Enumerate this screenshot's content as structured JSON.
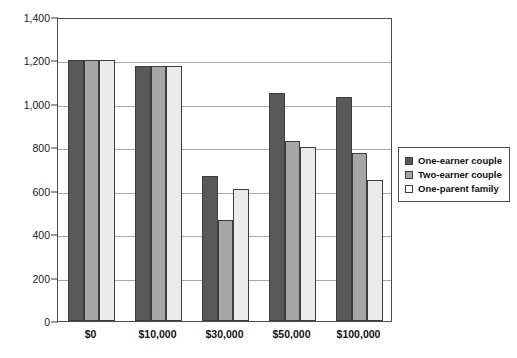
{
  "chart_data": {
    "type": "bar",
    "title": "",
    "subtitle": "",
    "xlabel": "",
    "ylabel": "",
    "categories": [
      "$0",
      "$10,000",
      "$30,000",
      "$50,000",
      "$100,000"
    ],
    "series": [
      {
        "name": "One-earner couple",
        "color": "#595959",
        "values": [
          1200,
          1175,
          670,
          1050,
          1030
        ]
      },
      {
        "name": "Two-earner couple",
        "color": "#a6a6a6",
        "values": [
          1200,
          1175,
          465,
          830,
          775
        ]
      },
      {
        "name": "One-parent family",
        "color": "#ebebeb",
        "values": [
          1200,
          1175,
          610,
          800,
          650
        ]
      }
    ],
    "ylim": [
      0,
      1400
    ],
    "ytick_values": [
      0,
      200,
      400,
      600,
      800,
      1000,
      1200,
      1400
    ],
    "ytick_labels": [
      "0",
      "200",
      "400",
      "600",
      "800",
      "1,000",
      "1,200",
      "1,400"
    ],
    "grid": true,
    "grid_axis": "y",
    "legend_position": "right",
    "annotations": []
  },
  "legend": {
    "entries": [
      {
        "label": "One-earner couple",
        "swatch": "#595959"
      },
      {
        "label": "Two-earner couple",
        "swatch": "#a6a6a6"
      },
      {
        "label": "One-parent family",
        "swatch": "#ffffff"
      }
    ]
  },
  "colors": {
    "series_one": "#595959",
    "series_two": "#a6a6a6",
    "series_three": "#ebebeb",
    "axis": "#4d4d4d",
    "gridline": "#a9a9a9",
    "text": "#111111",
    "background": "#ffffff"
  }
}
